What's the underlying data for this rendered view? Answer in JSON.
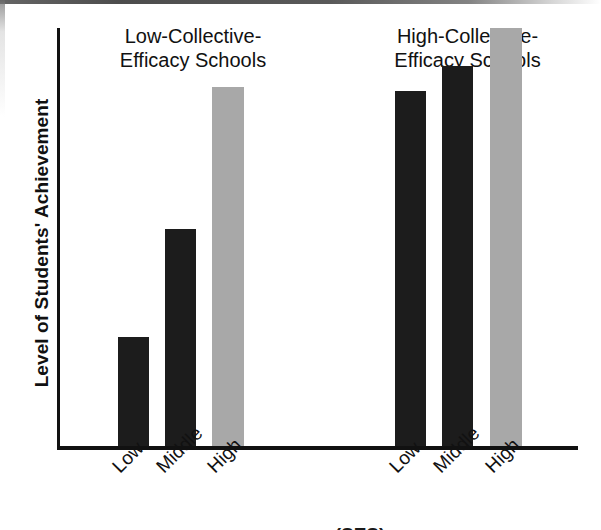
{
  "chart_data": {
    "type": "bar",
    "title": "",
    "xlabel": "",
    "ylabel": "Level of Students' Achievement",
    "ylim": [
      0,
      100
    ],
    "grid": false,
    "legend": "none",
    "categories": [
      "Low",
      "Middle",
      "High"
    ],
    "groups": [
      {
        "name": "Low-Collective-Efficacy Schools",
        "title_line1": "Low-Collective-",
        "title_line2": "Efficacy Schools",
        "bars": [
          {
            "category": "Low",
            "value": 26,
            "color": "#1c1c1c",
            "shade": "dark"
          },
          {
            "category": "Middle",
            "value": 52,
            "color": "#1c1c1c",
            "shade": "dark"
          },
          {
            "category": "High",
            "value": 86,
            "color": "#a8a8a8",
            "shade": "gray"
          }
        ]
      },
      {
        "name": "High-Collective-Efficacy Schools",
        "title_line1": "High-Collective-",
        "title_line2": "Efficacy Schools",
        "bars": [
          {
            "category": "Low",
            "value": 85,
            "color": "#1c1c1c",
            "shade": "dark"
          },
          {
            "category": "Middle",
            "value": 91,
            "color": "#1c1c1c",
            "shade": "dark"
          },
          {
            "category": "High",
            "value": 100,
            "color": "#a8a8a8",
            "shade": "gray"
          }
        ]
      }
    ],
    "colors": {
      "dark_bar": "#1c1c1c",
      "gray_bar": "#a8a8a8",
      "axis": "#111111",
      "text": "#111111",
      "background": "#ffffff"
    }
  },
  "axis": {
    "y_title": "Level of Students' Achievement"
  },
  "caption": {
    "clipped_text": "(SES)"
  }
}
